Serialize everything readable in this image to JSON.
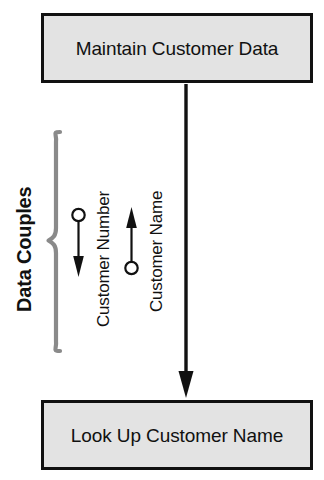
{
  "diagram": {
    "type": "structure-chart",
    "background_color": "#ffffff",
    "modules": [
      {
        "id": "maintain-customer-data",
        "label": "Maintain Customer Data",
        "role": "calling-module",
        "fill_color": "#e3e3e3",
        "border_color": "#111111"
      },
      {
        "id": "look-up-customer-name",
        "label": "Look Up Customer Name",
        "role": "called-module",
        "fill_color": "#e3e3e3",
        "border_color": "#111111"
      }
    ],
    "invocation_arrow": {
      "label": "",
      "direction": "down",
      "color": "#111111"
    },
    "group": {
      "label": "Data Couples",
      "brace_color": "#8a8a8a",
      "label_color": "#111111"
    },
    "couples": [
      {
        "id": "customer-number",
        "label": "Customer Number",
        "direction": "down",
        "marker": "open-circle",
        "kind": "data-couple",
        "color": "#111111"
      },
      {
        "id": "customer-name",
        "label": "Customer Name",
        "direction": "up",
        "marker": "open-circle",
        "kind": "data-couple",
        "color": "#111111"
      }
    ]
  }
}
